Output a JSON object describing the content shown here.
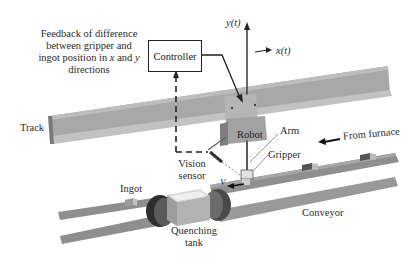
{
  "diagram": {
    "type": "system-schematic",
    "labels": {
      "feedback_line1": "Feedback of difference",
      "feedback_line2": "between gripper and",
      "feedback_line3": "ingot position in",
      "feedback_x": "x",
      "feedback_and": "and",
      "feedback_y": "y",
      "feedback_line4": "directions",
      "controller": "Controller",
      "y_axis": "y(t)",
      "x_axis": "x(t)",
      "track": "Track",
      "robot": "Robot",
      "arm": "Arm",
      "from_furnace": "From furnace",
      "gripper": "Gripper",
      "vision_line1": "Vision",
      "vision_line2": "sensor",
      "velocity": "V",
      "ingot": "Ingot",
      "conveyor": "Conveyor",
      "quench_line1": "Quenching",
      "quench_line2": "tank"
    },
    "colors": {
      "track": "#a9a9a9",
      "track_shadow": "#8c8c8c",
      "conveyor": "#9a9a9a",
      "roller": "#555555",
      "robot_body": "#b0b0b0",
      "line": "#222222",
      "background": "#ffffff"
    }
  }
}
